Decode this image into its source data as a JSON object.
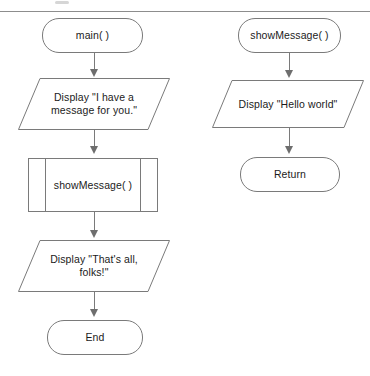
{
  "diagram": {
    "type": "flowchart",
    "stroke_color": "#7a7a7a",
    "text_color": "#1b1b1b",
    "background_color": "#ffffff",
    "columns": [
      {
        "name": "main-flow",
        "nodes": [
          {
            "id": "main-start",
            "shape": "terminal",
            "label": "main( )"
          },
          {
            "id": "display-message",
            "shape": "parallelogram",
            "label": "Display \"I have a\nmessage for you.\""
          },
          {
            "id": "call-showmessage",
            "shape": "subroutine",
            "label": "showMessage( )"
          },
          {
            "id": "display-thats-all",
            "shape": "parallelogram",
            "label": "Display \"That's all,\nfolks!\""
          },
          {
            "id": "main-end",
            "shape": "terminal",
            "label": "End"
          }
        ]
      },
      {
        "name": "showmessage-flow",
        "nodes": [
          {
            "id": "showmessage-start",
            "shape": "terminal",
            "label": "showMessage( )"
          },
          {
            "id": "display-hello",
            "shape": "parallelogram",
            "label": "Display \"Hello world\""
          },
          {
            "id": "showmessage-return",
            "shape": "terminal",
            "label": "Return"
          }
        ]
      }
    ],
    "connectors": [
      {
        "from": "main-start",
        "to": "display-message",
        "arrow": "down"
      },
      {
        "from": "display-message",
        "to": "call-showmessage",
        "arrow": "down"
      },
      {
        "from": "call-showmessage",
        "to": "display-thats-all",
        "arrow": "down"
      },
      {
        "from": "display-thats-all",
        "to": "main-end",
        "arrow": "down"
      },
      {
        "from": "showmessage-start",
        "to": "display-hello",
        "arrow": "down"
      },
      {
        "from": "display-hello",
        "to": "showmessage-return",
        "arrow": "down"
      }
    ]
  }
}
